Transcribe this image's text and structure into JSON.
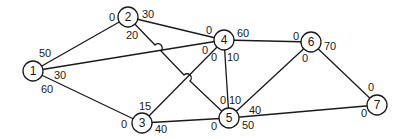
{
  "diagram": {
    "type": "network-flow-graph",
    "nodes": [
      {
        "id": "1",
        "label": "1",
        "x": 33,
        "y": 71
      },
      {
        "id": "2",
        "label": "2",
        "x": 128,
        "y": 17
      },
      {
        "id": "3",
        "label": "3",
        "x": 142,
        "y": 123
      },
      {
        "id": "4",
        "label": "4",
        "x": 224,
        "y": 40
      },
      {
        "id": "5",
        "label": "5",
        "x": 229,
        "y": 118
      },
      {
        "id": "6",
        "label": "6",
        "x": 311,
        "y": 42
      },
      {
        "id": "7",
        "label": "7",
        "x": 377,
        "y": 105
      }
    ],
    "edges": [
      {
        "from": "1",
        "to": "2"
      },
      {
        "from": "1",
        "to": "4"
      },
      {
        "from": "1",
        "to": "3"
      },
      {
        "from": "2",
        "to": "4"
      },
      {
        "from": "2",
        "to": "5"
      },
      {
        "from": "3",
        "to": "4"
      },
      {
        "from": "3",
        "to": "5"
      },
      {
        "from": "4",
        "to": "5"
      },
      {
        "from": "4",
        "to": "6"
      },
      {
        "from": "5",
        "to": "6"
      },
      {
        "from": "5",
        "to": "7"
      },
      {
        "from": "6",
        "to": "7"
      }
    ],
    "edge_labels": [
      {
        "text": "50",
        "x": 45,
        "y": 53,
        "near": "1",
        "edge": "1-2"
      },
      {
        "text": "30",
        "x": 60,
        "y": 75,
        "near": "1",
        "edge": "1-4"
      },
      {
        "text": "60",
        "x": 47,
        "y": 89,
        "near": "1",
        "edge": "1-3"
      },
      {
        "text": "0",
        "x": 112,
        "y": 17,
        "near": "2",
        "edge": "1-2"
      },
      {
        "text": "30",
        "x": 148,
        "y": 14,
        "near": "2",
        "edge": "2-4"
      },
      {
        "text": "20",
        "x": 132,
        "y": 35,
        "near": "2",
        "edge": "2-5"
      },
      {
        "text": "15",
        "x": 145,
        "y": 106,
        "near": "3",
        "edge": "3-4"
      },
      {
        "text": "0",
        "x": 124,
        "y": 124,
        "near": "3",
        "edge": "1-3"
      },
      {
        "text": "40",
        "x": 161,
        "y": 129,
        "near": "3",
        "edge": "3-5"
      },
      {
        "text": "0",
        "x": 209,
        "y": 30,
        "near": "4",
        "edge": "2-4"
      },
      {
        "text": "60",
        "x": 243,
        "y": 33,
        "near": "4",
        "edge": "4-6"
      },
      {
        "text": "0",
        "x": 205,
        "y": 50,
        "near": "4",
        "edge": "1-4"
      },
      {
        "text": "0",
        "x": 214,
        "y": 57,
        "near": "4",
        "edge": "3-4"
      },
      {
        "text": "10",
        "x": 233,
        "y": 57,
        "near": "4",
        "edge": "4-5"
      },
      {
        "text": "0",
        "x": 296,
        "y": 36,
        "near": "6",
        "edge": "4-6"
      },
      {
        "text": "70",
        "x": 330,
        "y": 46,
        "near": "6",
        "edge": "6-7"
      },
      {
        "text": "0",
        "x": 305,
        "y": 58,
        "near": "6",
        "edge": "5-6"
      },
      {
        "text": "0",
        "x": 223,
        "y": 100,
        "near": "5",
        "edge": "2-5"
      },
      {
        "text": "10",
        "x": 235,
        "y": 100,
        "near": "5",
        "edge": "4-5"
      },
      {
        "text": "40",
        "x": 255,
        "y": 110,
        "near": "5",
        "edge": "5-6"
      },
      {
        "text": "0",
        "x": 214,
        "y": 126,
        "near": "5",
        "edge": "3-5"
      },
      {
        "text": "50",
        "x": 248,
        "y": 125,
        "near": "5",
        "edge": "5-7"
      },
      {
        "text": "0",
        "x": 371,
        "y": 87,
        "near": "7",
        "edge": "6-7"
      },
      {
        "text": "0",
        "x": 364,
        "y": 113,
        "near": "7",
        "edge": "5-7"
      }
    ],
    "colors": {
      "stroke": "#1a1a1a",
      "background": "#ffffff"
    }
  }
}
